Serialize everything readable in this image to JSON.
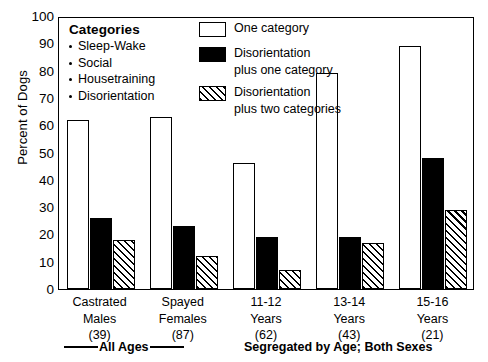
{
  "chart_data": {
    "type": "bar",
    "title": "",
    "xlabel": "",
    "ylabel": "Percent of Dogs",
    "ylim": [
      0,
      100
    ],
    "yticks": [
      0,
      10,
      20,
      30,
      40,
      50,
      60,
      70,
      80,
      90,
      100
    ],
    "grid": false,
    "legend_position": "top-right-inside",
    "categories": [
      "Castrated Males",
      "Spayed Females",
      "11-12 Years",
      "13-14 Years",
      "15-16 Years"
    ],
    "category_lines": [
      [
        "Castrated",
        "Males",
        "(39)"
      ],
      [
        "Spayed",
        "Females",
        "(87)"
      ],
      [
        "11-12",
        "Years",
        "(62)"
      ],
      [
        "13-14",
        "Years",
        "(43)"
      ],
      [
        "15-16",
        "Years",
        "(21)"
      ]
    ],
    "group_counts": [
      39,
      87,
      62,
      43,
      21
    ],
    "series": [
      {
        "name": "One category",
        "style": "open",
        "values": [
          62,
          63,
          46,
          79,
          89
        ]
      },
      {
        "name": "Disorientation plus one category",
        "style": "solid",
        "values": [
          26,
          23,
          19,
          19,
          48
        ]
      },
      {
        "name": "Disorientation plus two categories",
        "style": "hatch",
        "values": [
          18,
          12,
          7,
          17,
          29
        ]
      }
    ]
  },
  "categories_box": {
    "title": "Categories",
    "items": [
      "Sleep-Wake",
      "Social",
      "Housetraining",
      "Disorientation"
    ]
  },
  "legend": {
    "entries": [
      {
        "swatch": "open",
        "line1": "One category",
        "line2": ""
      },
      {
        "swatch": "solid",
        "line1": "Disorientation",
        "line2": "plus one category"
      },
      {
        "swatch": "hatch",
        "line1": "Disorientation",
        "line2": "plus two categories"
      }
    ]
  },
  "footer": {
    "left_label": "All Ages",
    "right_label": "Segregated by Age; Both Sexes"
  },
  "colors": {
    "axis": "#000000",
    "open_fill": "#ffffff",
    "solid_fill": "#000000",
    "hatch_fill": "#ffffff",
    "background": "#ffffff"
  }
}
